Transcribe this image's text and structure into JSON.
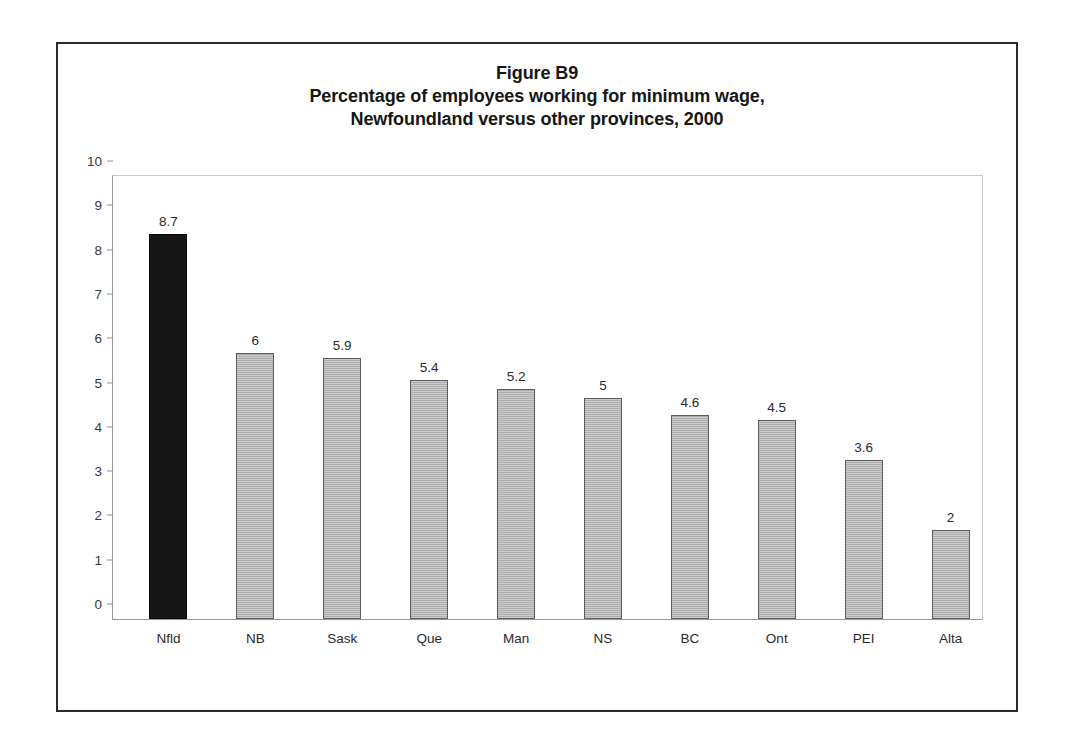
{
  "figure": {
    "title_lines": [
      "Figure B9",
      "Percentage of employees working for minimum wage,",
      "Newfoundland versus other provinces, 2000"
    ]
  },
  "chart_data": {
    "type": "bar",
    "xlabel": "",
    "ylabel": "",
    "ylim": [
      0,
      10
    ],
    "yticks": [
      "0",
      "1",
      "2",
      "3",
      "4",
      "5",
      "6",
      "7",
      "8",
      "9",
      "10"
    ],
    "grid": false,
    "legend": "none",
    "categories": [
      "Nfld",
      "NB",
      "Sask",
      "Que",
      "Man",
      "NS",
      "BC",
      "Ont",
      "PEI",
      "Alta"
    ],
    "values": [
      8.7,
      6,
      5.9,
      5.4,
      5.2,
      5,
      4.6,
      4.5,
      3.6,
      2
    ],
    "value_labels": [
      "8.7",
      "6",
      "5.9",
      "5.4",
      "5.2",
      "5",
      "4.6",
      "4.5",
      "3.6",
      "2"
    ],
    "highlight_index": 0,
    "colors": {
      "highlight_bar": "#151515",
      "bar_fill": "#b4b4b4",
      "bar_border": "#5c5c5c",
      "frame": "#2b2b2b",
      "axis": "#9a9a9a",
      "text": "#2a2a2a"
    }
  }
}
